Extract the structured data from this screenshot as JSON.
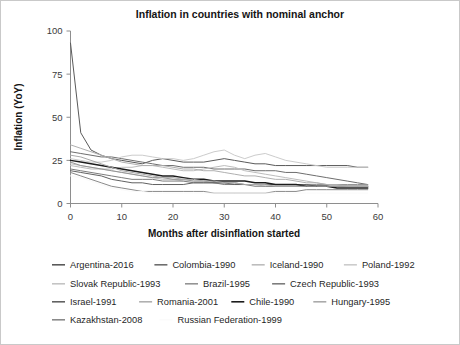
{
  "figure": {
    "background_color": "#ffffff",
    "border_color": "#c9c9c9"
  },
  "chart_data": {
    "type": "line",
    "title": "Inflation in countries with nominal anchor",
    "xlabel": "Months after disinflation started",
    "ylabel": "Inflation (YoY)",
    "xlim": [
      0,
      60
    ],
    "ylim": [
      0,
      100
    ],
    "xticks": [
      0,
      10,
      20,
      30,
      40,
      50,
      60
    ],
    "yticks": [
      0,
      25,
      50,
      75,
      100
    ],
    "xticklabels": [
      "0",
      "10",
      "20",
      "30",
      "40",
      "50",
      "60"
    ],
    "yticklabels": [
      "0",
      "25",
      "50",
      "75",
      "100"
    ],
    "grid": false,
    "legend_position": "below",
    "x": [
      0,
      2,
      4,
      6,
      8,
      10,
      12,
      14,
      16,
      18,
      20,
      22,
      24,
      26,
      28,
      30,
      32,
      34,
      36,
      38,
      40,
      42,
      44,
      46,
      48,
      50,
      52,
      54,
      56,
      58
    ],
    "series": [
      {
        "name": "Argentina-2016",
        "color": "#5a5a5a",
        "width": 1.0,
        "values": [
          93,
          41,
          31,
          28,
          26,
          25,
          24,
          23,
          25,
          26,
          25,
          24,
          24,
          24,
          25,
          26,
          25,
          24,
          23,
          23,
          22,
          22,
          22,
          22,
          22,
          22,
          22,
          22,
          21,
          21
        ]
      },
      {
        "name": "Colombia-1990",
        "color": "#6e6e6e",
        "width": 1.0,
        "values": [
          30,
          29,
          28,
          27,
          27,
          26,
          25,
          24,
          23,
          22,
          22,
          21,
          21,
          21,
          20,
          20,
          20,
          20,
          19,
          19,
          19,
          18,
          18,
          17,
          16,
          15,
          14,
          13,
          12,
          11
        ]
      },
      {
        "name": "Iceland-1990",
        "color": "#bdbdbd",
        "width": 1.0,
        "values": [
          22,
          21,
          20,
          20,
          20,
          21,
          21,
          22,
          22,
          21,
          20,
          19,
          19,
          20,
          21,
          22,
          21,
          19,
          18,
          17,
          16,
          15,
          14,
          13,
          12,
          11,
          11,
          10,
          10,
          10
        ]
      },
      {
        "name": "Poland-1992",
        "color": "#cccccc",
        "width": 1.0,
        "values": [
          26,
          25,
          24,
          24,
          25,
          27,
          28,
          28,
          27,
          26,
          26,
          25,
          26,
          28,
          30,
          31,
          28,
          26,
          28,
          29,
          27,
          25,
          24,
          23,
          22,
          21,
          21,
          21,
          21,
          21
        ]
      },
      {
        "name": "Slovak Republic-1993",
        "color": "#c4c4c4",
        "width": 1.0,
        "values": [
          23,
          22,
          21,
          20,
          19,
          18,
          17,
          16,
          15,
          14,
          14,
          13,
          13,
          13,
          12,
          12,
          12,
          11,
          11,
          10,
          10,
          10,
          10,
          10,
          10,
          10,
          10,
          10,
          10,
          10
        ]
      },
      {
        "name": "Brazil-1995",
        "color": "#949494",
        "width": 1.0,
        "values": [
          24,
          22,
          21,
          20,
          19,
          18,
          17,
          16,
          15,
          15,
          14,
          14,
          13,
          13,
          12,
          12,
          12,
          11,
          11,
          11,
          11,
          11,
          11,
          11,
          11,
          11,
          11,
          11,
          11,
          11
        ]
      },
      {
        "name": "Czech Republic-1993",
        "color": "#7d7d7d",
        "width": 1.0,
        "values": [
          20,
          19,
          18,
          17,
          16,
          15,
          14,
          14,
          14,
          13,
          13,
          13,
          12,
          12,
          12,
          11,
          11,
          11,
          10,
          10,
          10,
          10,
          10,
          10,
          10,
          10,
          10,
          10,
          10,
          10
        ]
      },
      {
        "name": "Israel-1991",
        "color": "#626262",
        "width": 1.0,
        "values": [
          19,
          18,
          17,
          16,
          14,
          13,
          12,
          12,
          11,
          11,
          11,
          11,
          12,
          12,
          12,
          12,
          11,
          11,
          11,
          11,
          11,
          11,
          11,
          11,
          10,
          10,
          10,
          10,
          10,
          10
        ]
      },
      {
        "name": "Romania-2001",
        "color": "#b0b0b0",
        "width": 1.0,
        "values": [
          34,
          32,
          30,
          28,
          26,
          24,
          23,
          22,
          22,
          22,
          21,
          20,
          20,
          19,
          19,
          18,
          17,
          16,
          16,
          15,
          14,
          14,
          13,
          12,
          12,
          11,
          11,
          10,
          10,
          10
        ]
      },
      {
        "name": "Chile-1990",
        "color": "#1c1c1c",
        "width": 1.5,
        "values": [
          25,
          24,
          23,
          22,
          21,
          20,
          19,
          18,
          17,
          16,
          16,
          15,
          14,
          14,
          13,
          13,
          13,
          13,
          12,
          12,
          11,
          11,
          11,
          10,
          10,
          10,
          9,
          9,
          9,
          9
        ]
      },
      {
        "name": "Hungary-1995",
        "color": "#aaaaaa",
        "width": 1.0,
        "values": [
          28,
          27,
          25,
          23,
          21,
          19,
          18,
          17,
          16,
          15,
          15,
          14,
          14,
          13,
          13,
          12,
          12,
          11,
          11,
          11,
          10,
          10,
          10,
          10,
          10,
          10,
          10,
          10,
          10,
          10
        ]
      },
      {
        "name": "Kazakhstan-2008",
        "color": "#8a8a8a",
        "width": 1.0,
        "values": [
          18,
          16,
          14,
          12,
          10,
          9,
          8,
          7,
          7,
          7,
          7,
          7,
          7,
          7,
          6,
          6,
          6,
          6,
          6,
          6,
          7,
          7,
          7,
          8,
          8,
          8,
          8,
          8,
          8,
          8
        ]
      },
      {
        "name": "Russian Federation-1999",
        "color": "#fafafa",
        "width": 1.0,
        "values": [
          16,
          15,
          13,
          11,
          9,
          8,
          7,
          7,
          6,
          6,
          6,
          6,
          6,
          6,
          6,
          6,
          6,
          6,
          6,
          6,
          6,
          6,
          6,
          6,
          6,
          6,
          6,
          6,
          6,
          6
        ]
      }
    ]
  },
  "legend": {
    "rows": [
      [
        {
          "label": "Argentina-2016",
          "color": "#5a5a5a",
          "width": 1.6
        },
        {
          "label": "Colombia-1990",
          "color": "#6e6e6e",
          "width": 1.6
        },
        {
          "label": "Iceland-1990",
          "color": "#bdbdbd",
          "width": 1.6
        },
        {
          "label": "Poland-1992",
          "color": "#cccccc",
          "width": 1.6
        }
      ],
      [
        {
          "label": "Slovak Republic-1993",
          "color": "#c4c4c4",
          "width": 1.6
        },
        {
          "label": "Brazil-1995",
          "color": "#949494",
          "width": 1.6
        },
        {
          "label": "Czech Republic-1993",
          "color": "#7d7d7d",
          "width": 1.6
        }
      ],
      [
        {
          "label": "Israel-1991",
          "color": "#626262",
          "width": 1.6
        },
        {
          "label": "Romania-2001",
          "color": "#b0b0b0",
          "width": 1.6
        },
        {
          "label": "Chile-1990",
          "color": "#1c1c1c",
          "width": 2.4
        },
        {
          "label": "Hungary-1995",
          "color": "#aaaaaa",
          "width": 1.6
        }
      ],
      [
        {
          "label": "Kazakhstan-2008",
          "color": "#8a8a8a",
          "width": 1.6
        },
        {
          "label": "Russian Federation-1999",
          "color": "#fbfbfb",
          "width": 1.6
        }
      ]
    ]
  }
}
